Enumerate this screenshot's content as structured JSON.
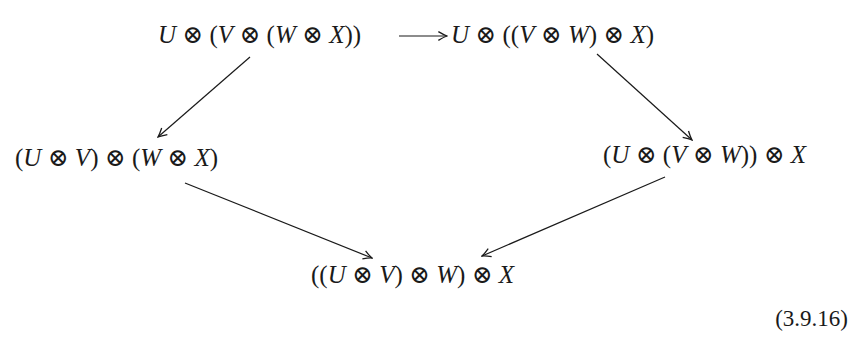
{
  "diagram": {
    "nodes": [
      {
        "id": "top_left",
        "label": "U ⊗ (V ⊗ (W ⊗ X))"
      },
      {
        "id": "top_right",
        "label": "U ⊗ ((V ⊗ W) ⊗ X)"
      },
      {
        "id": "mid_left",
        "label": "(U ⊗ V) ⊗ (W ⊗ X)"
      },
      {
        "id": "mid_right",
        "label": "(U ⊗ (V ⊗ W)) ⊗ X"
      },
      {
        "id": "bottom",
        "label": "((U ⊗ V) ⊗ W) ⊗ X"
      }
    ],
    "edges": [
      {
        "from": "top_left",
        "to": "top_right"
      },
      {
        "from": "top_left",
        "to": "mid_left"
      },
      {
        "from": "top_right",
        "to": "mid_right"
      },
      {
        "from": "mid_left",
        "to": "bottom"
      },
      {
        "from": "mid_right",
        "to": "bottom"
      }
    ],
    "equation_number": "(3.9.16)",
    "colors": {
      "ink": "#1a1a1a",
      "background": "#ffffff"
    }
  }
}
